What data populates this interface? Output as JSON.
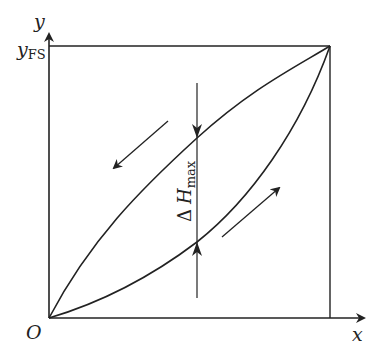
{
  "diagram": {
    "axes": {
      "x_label": "x",
      "y_label": "y",
      "origin_label": "O",
      "y_fullscale_label": "y",
      "y_fullscale_subscript": "FS"
    },
    "annotation": {
      "delta_symbol": "Δ",
      "variable": "H",
      "subscript": "max"
    },
    "curves": [
      {
        "name": "loading-curve",
        "direction": "increasing"
      },
      {
        "name": "unloading-curve",
        "direction": "decreasing"
      }
    ],
    "colors": {
      "stroke": "#222222",
      "background": "#ffffff"
    }
  }
}
